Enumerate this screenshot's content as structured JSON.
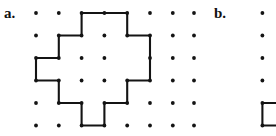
{
  "figure": {
    "background_color": "#ffffff",
    "ink_color": "#141414",
    "width": 276,
    "height": 136
  },
  "panels": [
    {
      "id": "a",
      "label": "a.",
      "label_x": 4,
      "label_y": 6,
      "grid": {
        "origin_x": 36,
        "origin_y": 13,
        "spacing_x": 22.8,
        "spacing_y": 22.5,
        "cols": 7,
        "rows": 6,
        "dot_radius": 1.9,
        "visible_cols": [
          0,
          1,
          2,
          3,
          4,
          5,
          6
        ],
        "visible_rows": [
          0,
          1,
          2,
          3,
          4,
          5
        ]
      },
      "polygon": {
        "closed": true,
        "stroke_width": 2.1,
        "vertices_grid": [
          [
            2,
            0
          ],
          [
            4,
            0
          ],
          [
            4,
            1
          ],
          [
            5,
            1
          ],
          [
            5,
            3
          ],
          [
            4,
            3
          ],
          [
            4,
            4
          ],
          [
            3,
            4
          ],
          [
            3,
            5
          ],
          [
            2,
            5
          ],
          [
            2,
            4
          ],
          [
            1,
            4
          ],
          [
            1,
            3
          ],
          [
            0,
            3
          ],
          [
            0,
            2
          ],
          [
            1,
            2
          ],
          [
            1,
            1
          ],
          [
            2,
            1
          ]
        ],
        "vertex_dots_grid": [
          [
            2,
            0
          ],
          [
            3,
            0
          ],
          [
            4,
            0
          ],
          [
            4,
            1
          ],
          [
            5,
            1
          ],
          [
            5,
            2
          ],
          [
            5,
            3
          ],
          [
            4,
            3
          ],
          [
            4,
            4
          ],
          [
            3,
            4
          ],
          [
            3,
            5
          ],
          [
            2,
            5
          ],
          [
            2,
            4
          ],
          [
            1,
            4
          ],
          [
            1,
            3
          ],
          [
            0,
            3
          ],
          [
            0,
            2
          ],
          [
            1,
            2
          ],
          [
            1,
            1
          ],
          [
            2,
            1
          ],
          [
            3,
            1
          ],
          [
            3,
            2
          ],
          [
            3,
            3
          ],
          [
            2,
            3
          ],
          [
            2,
            2
          ]
        ]
      },
      "plain_dots_grid": [
        [
          0,
          0
        ],
        [
          1,
          0
        ],
        [
          5,
          0
        ],
        [
          6,
          0
        ],
        [
          6,
          1
        ],
        [
          0,
          1
        ],
        [
          6,
          2
        ],
        [
          6,
          3
        ],
        [
          0,
          4
        ],
        [
          5,
          4
        ],
        [
          6,
          4
        ],
        [
          0,
          5
        ],
        [
          1,
          5
        ],
        [
          4,
          5
        ],
        [
          5,
          5
        ],
        [
          6,
          5
        ]
      ]
    },
    {
      "id": "b",
      "label": "b.",
      "label_x": 214,
      "label_y": 6,
      "grid": {
        "origin_x": 194,
        "origin_y": 13,
        "spacing_x": 22.8,
        "spacing_y": 22.5,
        "cols": 4,
        "rows": 6,
        "dot_radius": 1.9,
        "cropped": true,
        "note": "panel b is clipped by the right edge of the screenshot"
      },
      "plain_dots_grid": [
        [
          0,
          0
        ],
        [
          0,
          1
        ],
        [
          0,
          2
        ],
        [
          0,
          3
        ],
        [
          0,
          4
        ],
        [
          0,
          5
        ],
        [
          3,
          0
        ],
        [
          3,
          1
        ],
        [
          3,
          2
        ],
        [
          3,
          3
        ]
      ],
      "partial_polygon": {
        "closed": false,
        "stroke_width": 2.1,
        "vertices_grid": [
          [
            4,
            4
          ],
          [
            3,
            4
          ],
          [
            3,
            5
          ],
          [
            4,
            5
          ]
        ],
        "vertex_dots_grid": [
          [
            3,
            4
          ],
          [
            3,
            5
          ]
        ]
      }
    }
  ]
}
